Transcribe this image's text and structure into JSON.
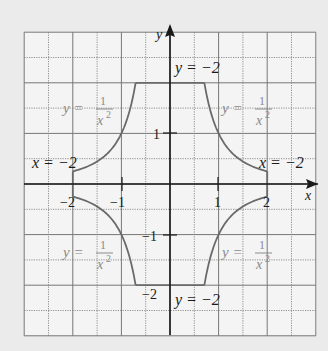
{
  "chart_data": {
    "type": "line",
    "title": "",
    "xlabel": "x",
    "ylabel": "y",
    "xlim": [
      -3,
      3
    ],
    "ylim": [
      -3,
      3
    ],
    "grid": true,
    "grid_step": 0.5,
    "x_ticks": [
      {
        "value": -2,
        "label": "−2"
      },
      {
        "value": -1,
        "label": "−1"
      },
      {
        "value": 1,
        "label": "1"
      },
      {
        "value": 2,
        "label": "2"
      }
    ],
    "y_ticks": [
      {
        "value": 1,
        "label": "1"
      },
      {
        "value": -1,
        "label": "−1"
      },
      {
        "value": -2,
        "label": "−2"
      }
    ],
    "series": [
      {
        "name": "y = 1/x^2 (upper-left)",
        "function": "1/x^2",
        "x_range": [
          -2,
          -0.7071
        ]
      },
      {
        "name": "y = 2 (top boundary)",
        "points": [
          [
            -0.7071,
            2
          ],
          [
            0.7071,
            2
          ]
        ]
      },
      {
        "name": "y = 1/x^2 (upper-right)",
        "function": "1/x^2",
        "x_range": [
          0.7071,
          2
        ]
      },
      {
        "name": "x = 2 (right boundary)",
        "points": [
          [
            2,
            0.25
          ],
          [
            2,
            -0.25
          ]
        ]
      },
      {
        "name": "y = -1/x^2 (lower-right)",
        "function": "-1/x^2",
        "x_range": [
          0.7071,
          2
        ]
      },
      {
        "name": "y = -2 (bottom boundary)",
        "points": [
          [
            -0.7071,
            -2
          ],
          [
            0.7071,
            -2
          ]
        ]
      },
      {
        "name": "y = -1/x^2 (lower-left)",
        "function": "-1/x^2",
        "x_range": [
          -2,
          -0.7071
        ]
      },
      {
        "name": "x = -2 (left boundary)",
        "points": [
          [
            -2,
            0.25
          ],
          [
            -2,
            -0.25
          ]
        ]
      }
    ],
    "annotations": [
      {
        "text_parts": [
          "y = −2"
        ],
        "x": 0.1,
        "y": 2.3,
        "style": "dark"
      },
      {
        "text_parts": [
          "y = −2"
        ],
        "x": 0.1,
        "y": -2.3,
        "style": "dark"
      },
      {
        "text_parts": [
          "x = −2"
        ],
        "x": -3.0,
        "y": 0.3,
        "style": "dark"
      },
      {
        "text_parts": [
          "x = −2"
        ],
        "x": 1.5,
        "y": 0.3,
        "style": "dark"
      },
      {
        "text_parts": [
          "y =",
          "1",
          "x2"
        ],
        "x": -2.2,
        "y": 1.55,
        "style": "grey"
      },
      {
        "text_parts": [
          "y =",
          "1",
          "x2"
        ],
        "x": 1.2,
        "y": 1.55,
        "style": "grey"
      },
      {
        "text_parts": [
          "y =",
          "1",
          "x2"
        ],
        "x": -2.2,
        "y": -1.5,
        "style": "grey"
      },
      {
        "text_parts": [
          "y =",
          "1",
          "x2"
        ],
        "x": 1.2,
        "y": -1.5,
        "style": "grey"
      }
    ]
  },
  "labels": {
    "axis_x": "x",
    "axis_y": "y",
    "top_boundary": "y = −2",
    "bottom_boundary": "y = −2",
    "left_boundary": "x = −2",
    "right_boundary": "x = −2",
    "curve_eq_lhs": "y =",
    "curve_eq_num": "1",
    "curve_eq_den": "x",
    "curve_eq_exp": "2",
    "tick_x_m2": "−2",
    "tick_x_m1": "−1",
    "tick_x_1": "1",
    "tick_x_2": "2",
    "tick_y_1": "1",
    "tick_y_m1": "−1",
    "tick_y_m2": "−2"
  },
  "colors": {
    "background": "#ebebeb",
    "grid_bg": "#f4f4f4",
    "grid_line": "#777777",
    "axis": "#1a1a1a",
    "curve": "#6a6a6a",
    "label_grey": "#8a8a8a"
  }
}
